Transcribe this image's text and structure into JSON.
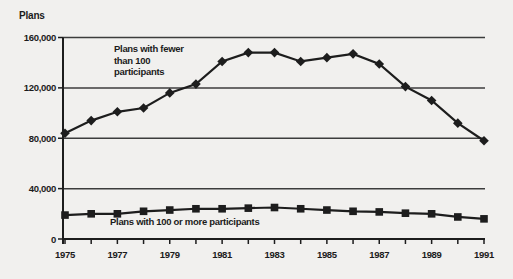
{
  "figure": {
    "kind": "scanned line chart"
  },
  "chart_data": {
    "type": "line",
    "title": "",
    "ylabel": "Plans",
    "xlabel": "",
    "x": [
      1975,
      1976,
      1977,
      1978,
      1979,
      1980,
      1981,
      1982,
      1983,
      1984,
      1985,
      1986,
      1987,
      1988,
      1989,
      1990,
      1991
    ],
    "series": [
      {
        "name": "Plans with fewer than 100 participants",
        "marker": "diamond",
        "values": [
          84000,
          94000,
          101000,
          104000,
          116000,
          123000,
          141000,
          148000,
          148000,
          141000,
          144000,
          147000,
          139000,
          121000,
          110000,
          92000,
          78000
        ]
      },
      {
        "name": "Plans with 100 or more participants",
        "marker": "square",
        "values": [
          19000,
          20000,
          20000,
          22000,
          23000,
          24000,
          24000,
          24500,
          25000,
          24000,
          23000,
          22000,
          21500,
          20500,
          20000,
          17500,
          16000
        ]
      }
    ],
    "ylim": [
      0,
      160000
    ],
    "yticks": {
      "values": [
        0,
        40000,
        80000,
        120000,
        160000
      ],
      "labels": [
        "0",
        "40,000",
        "80,000",
        "120,000",
        "160,000"
      ]
    },
    "xticks": {
      "labeled": [
        1975,
        1977,
        1979,
        1981,
        1983,
        1985,
        1987,
        1989,
        1991
      ],
      "minor_tick_every_year": true
    },
    "grid": "horizontal",
    "legend_position": "inline-annotations",
    "annotations": [
      {
        "series": "Plans with fewer than 100 participants",
        "lines": [
          "Plans with fewer",
          "than 100",
          "participants"
        ]
      },
      {
        "series": "Plans with 100 or more participants",
        "lines": [
          "Plans with 100 or more participants"
        ]
      }
    ],
    "colors": {
      "ink": "#1d1d1d",
      "grid": "#3c3c3c",
      "background": "#f1f0ee"
    },
    "layout": {
      "plot": {
        "left": 63,
        "right": 485,
        "top": 37.5,
        "bottom": 239
      },
      "x_first": 65,
      "x_last": 484,
      "tick_len": 5
    }
  }
}
